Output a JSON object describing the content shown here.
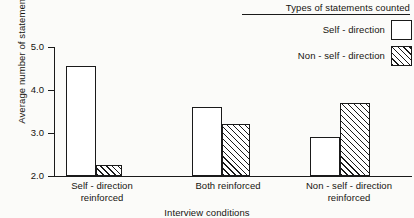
{
  "chart_data": {
    "type": "bar",
    "title": "",
    "xlabel": "Interview conditions",
    "ylabel": "Average number of statements",
    "categories": [
      "Self - direction reinforced",
      "Both reinforced",
      "Non - self - direction reinforced"
    ],
    "category_lines": [
      [
        "Self - direction",
        "reinforced"
      ],
      [
        "Both reinforced",
        ""
      ],
      [
        "Non - self - direction",
        "reinforced"
      ]
    ],
    "series": [
      {
        "name": "Self - direction",
        "values": [
          4.55,
          3.6,
          2.9
        ],
        "fill": "open"
      },
      {
        "name": "Non - self - direction",
        "values": [
          2.25,
          3.2,
          3.7
        ],
        "fill": "hatched"
      }
    ],
    "ylim": [
      2.0,
      5.0
    ],
    "yticks": [
      2.0,
      3.0,
      4.0,
      5.0
    ],
    "ytick_labels": [
      "2.0",
      "3.0",
      "4.0",
      "5.0"
    ],
    "grid": false,
    "legend_position": "top-right"
  },
  "legend": {
    "title": "Types of statements counted",
    "entries": [
      {
        "label": "Self - direction",
        "swatch": "open-square-swatch"
      },
      {
        "label": "Non - self - direction",
        "swatch": "hatched-square-swatch"
      }
    ]
  },
  "colors": {
    "ink": "#1a1a1a",
    "paper": "#fbfbf9",
    "bar_fill": "#ffffff"
  }
}
